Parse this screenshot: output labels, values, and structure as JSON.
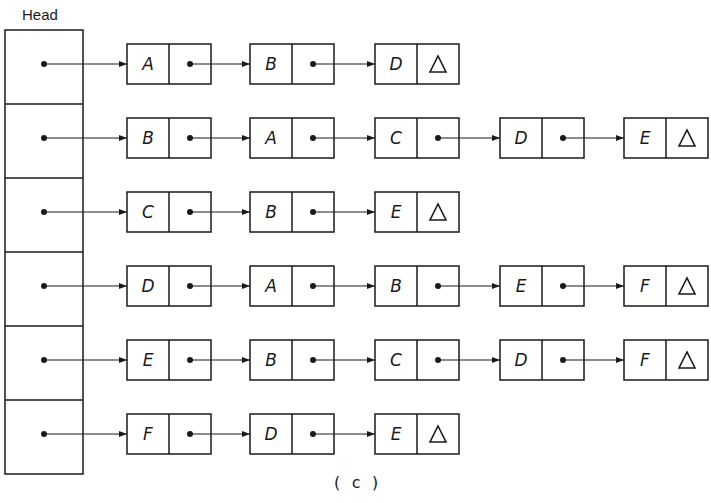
{
  "head": {
    "title": "Head",
    "rows": 6
  },
  "caption": "( c )",
  "null_symbol": "△",
  "lists": [
    {
      "vertex": "A",
      "nodes": [
        "A",
        "B",
        "D"
      ]
    },
    {
      "vertex": "B",
      "nodes": [
        "B",
        "A",
        "C",
        "D",
        "E"
      ]
    },
    {
      "vertex": "C",
      "nodes": [
        "C",
        "B",
        "E"
      ]
    },
    {
      "vertex": "D",
      "nodes": [
        "D",
        "A",
        "B",
        "E",
        "F"
      ]
    },
    {
      "vertex": "E",
      "nodes": [
        "E",
        "B",
        "C",
        "D",
        "F"
      ]
    },
    {
      "vertex": "F",
      "nodes": [
        "F",
        "D",
        "E"
      ]
    }
  ],
  "colors": {
    "ink": "#1a1a1a",
    "background": "#ffffff"
  }
}
